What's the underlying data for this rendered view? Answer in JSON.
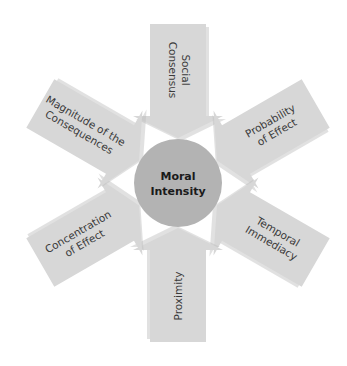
{
  "diagram": {
    "center": {
      "line1": "Moral",
      "line2": "Intensity"
    },
    "factors": [
      {
        "position": "top",
        "line1": "Social",
        "line2": "Consensus"
      },
      {
        "position": "upper-right",
        "line1": "Probability",
        "line2": "of Effect"
      },
      {
        "position": "lower-right",
        "line1": "Temporal",
        "line2": "Immediacy"
      },
      {
        "position": "bottom",
        "line1": "Proximity",
        "line2": ""
      },
      {
        "position": "lower-left",
        "line1": "Concentration",
        "line2": "of Effect"
      },
      {
        "position": "upper-left",
        "line1": "Magnitude of the",
        "line2": "Consequences"
      }
    ],
    "colors": {
      "arrow": "#d7d7d7",
      "circle": "#b3b3b3",
      "text": "#3a3a3a"
    }
  }
}
